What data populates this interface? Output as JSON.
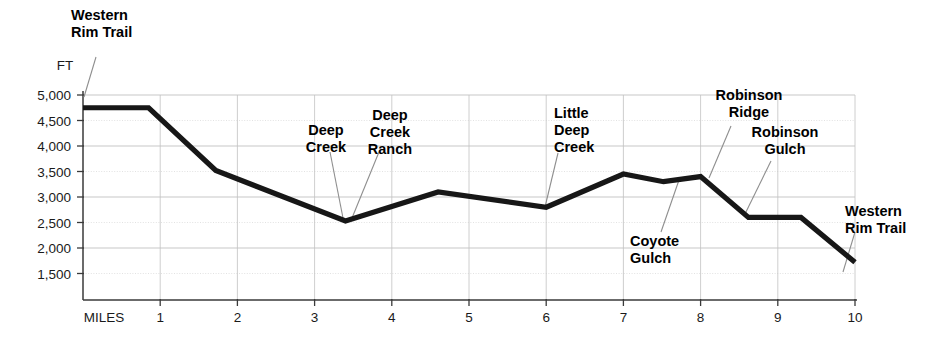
{
  "chart_data": {
    "type": "line",
    "title": "",
    "subtitle": "",
    "xlabel": "MILES",
    "ylabel": "FT",
    "y_unit_label": "FT",
    "x_axis_name_label": "MILES",
    "xlim": [
      0,
      10
    ],
    "ylim": [
      1000,
      5000
    ],
    "x_ticks": [
      1,
      2,
      3,
      4,
      5,
      6,
      7,
      8,
      9,
      10
    ],
    "x_tick_labels": [
      "1",
      "2",
      "3",
      "4",
      "5",
      "6",
      "7",
      "8",
      "9",
      "10"
    ],
    "y_ticks": [
      1500,
      2000,
      2500,
      3000,
      3500,
      4000,
      4500,
      5000
    ],
    "y_tick_labels": [
      "1,500",
      "2,000",
      "2,500",
      "3,000",
      "3,500",
      "4,000",
      "4,500",
      "5,000"
    ],
    "grid": true,
    "legend": false,
    "series": [
      {
        "name": "Elevation profile",
        "color": "#171717",
        "x": [
          0.0,
          0.85,
          1.72,
          3.4,
          4.6,
          6.0,
          7.0,
          7.52,
          8.0,
          8.62,
          9.3,
          10.0
        ],
        "values": [
          4750,
          4750,
          3520,
          2530,
          3100,
          2800,
          3450,
          3300,
          3400,
          2600,
          2600,
          1720
        ]
      }
    ],
    "annotations": [
      {
        "label": "Western Rim Trail",
        "lines": [
          "Western",
          "Rim Trail"
        ],
        "align": "start",
        "text_x": 71,
        "text_y": 20,
        "line_height": 17,
        "leader": {
          "x1": 96,
          "y1": 57,
          "x2": 84,
          "y2": 97
        }
      },
      {
        "label": "Deep Creek",
        "lines": [
          "Deep",
          "Creek"
        ],
        "align": "middle",
        "text_x": 326,
        "text_y": 135,
        "line_height": 17,
        "leader": {
          "x1": 330,
          "y1": 152,
          "x2": 343,
          "y2": 218
        }
      },
      {
        "label": "Deep Creek Ranch",
        "lines": [
          "Deep",
          "Creek",
          "Ranch"
        ],
        "align": "middle",
        "text_x": 390,
        "text_y": 120,
        "line_height": 17,
        "leader": {
          "x1": 379,
          "y1": 152,
          "x2": 352,
          "y2": 218
        }
      },
      {
        "label": "Little Deep Creek",
        "lines": [
          "Little",
          "Deep",
          "Creek"
        ],
        "align": "start",
        "text_x": 554,
        "text_y": 118,
        "line_height": 17,
        "leader": {
          "x1": 558,
          "y1": 153,
          "x2": 545,
          "y2": 207
        }
      },
      {
        "label": "Coyote Gulch",
        "lines": [
          "Coyote",
          "Gulch"
        ],
        "align": "start",
        "text_x": 630,
        "text_y": 246,
        "line_height": 17,
        "leader": {
          "x1": 661,
          "y1": 232,
          "x2": 679,
          "y2": 180
        }
      },
      {
        "label": "Robinson Ridge",
        "lines": [
          "Robinson",
          "Ridge"
        ],
        "align": "middle",
        "text_x": 749,
        "text_y": 100,
        "line_height": 17,
        "leader": {
          "x1": 731,
          "y1": 126,
          "x2": 709,
          "y2": 178
        }
      },
      {
        "label": "Robinson Gulch",
        "lines": [
          "Robinson",
          "Gulch"
        ],
        "align": "middle",
        "text_x": 785,
        "text_y": 137,
        "line_height": 17,
        "leader": {
          "x1": 771,
          "y1": 161,
          "x2": 744,
          "y2": 216
        }
      },
      {
        "label": "Western Rim Trail",
        "lines": [
          "Western",
          "Rim Trail"
        ],
        "align": "start",
        "text_x": 845,
        "text_y": 216,
        "line_height": 17,
        "leader": {
          "x1": 855,
          "y1": 232,
          "x2": 843,
          "y2": 272
        }
      }
    ]
  },
  "figure": {
    "background_color": "#ffffff",
    "line_color": "#171717",
    "grid_color": "#c2c2c2",
    "axis_color": "#3a3a3a",
    "text_color": "#1a1a1a"
  }
}
